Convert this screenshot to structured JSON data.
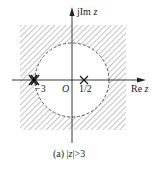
{
  "diagram": {
    "type": "z-plane pole-zero plot with region of convergence",
    "axes": {
      "imag_label_prefix": "jIm",
      "imag_label_var": "z",
      "real_label_prefix": "Re",
      "real_label_var": "z",
      "origin_label": "O"
    },
    "poles": [
      {
        "label": "−3",
        "value": -3,
        "order": 2
      },
      {
        "label": "1/2",
        "value": 0.5,
        "order": 1
      }
    ],
    "roc": {
      "description": "outside circle of radius 3, shaded",
      "radius": 3
    },
    "caption": {
      "prefix": "(a) |",
      "var": "z",
      "suffix": "|>3"
    },
    "colors": {
      "line": "#222222",
      "hatch": "#8a8a8a",
      "background": "#ffffff"
    }
  }
}
